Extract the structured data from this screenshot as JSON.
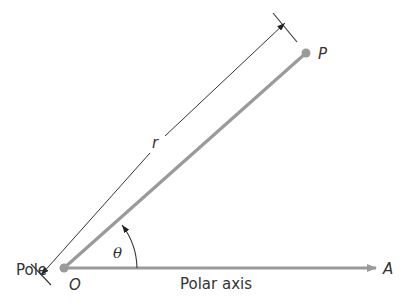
{
  "diagram": {
    "labels": {
      "pole": "Pole",
      "origin": "O",
      "point": "P",
      "radius": "r",
      "angle": "θ",
      "polar_axis": "Polar axis",
      "axis_end": "A"
    },
    "colors": {
      "ray": "#9a9a9a",
      "axis": "#9a9a9a",
      "dimension": "#333333",
      "text": "#333333"
    }
  }
}
